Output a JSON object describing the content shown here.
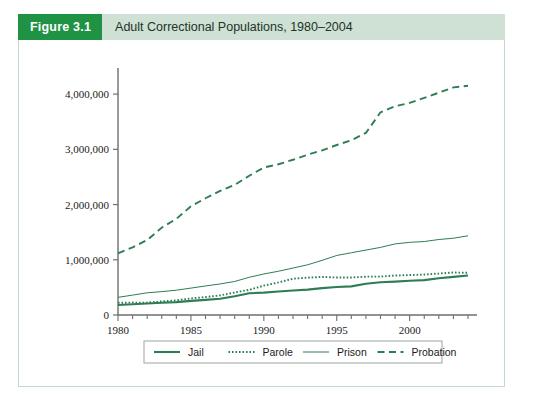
{
  "figure": {
    "number_label": "Figure 3.1",
    "title": "Adult Correctional Populations, 1980–2004"
  },
  "colors": {
    "header_badge_green": "#1f9244",
    "header_band_green": "#cfe0d4",
    "frame_border": "#c3d9c9",
    "series_green": "#2f7d52",
    "axis_gray": "#6e6e6e",
    "text_black": "#1a1a1a"
  },
  "chart_data": {
    "type": "line",
    "title": "Adult Correctional Populations, 1980–2004",
    "xlabel": "",
    "ylabel": "",
    "xlim": [
      1980,
      2004
    ],
    "ylim": [
      0,
      4400000
    ],
    "grid": false,
    "legend_position": "bottom",
    "x_ticks_major": [
      1980,
      1985,
      1990,
      1995,
      2000
    ],
    "x_tick_labels": [
      "1980",
      "1985",
      "1990",
      "1995",
      "2000"
    ],
    "x_ticks_minor_step": 1,
    "y_ticks": [
      0,
      1000000,
      2000000,
      3000000,
      4000000
    ],
    "y_tick_labels": [
      "0",
      "1,000,000",
      "2,000,000",
      "3,000,000",
      "4,000,000"
    ],
    "x": [
      1980,
      1981,
      1982,
      1983,
      1984,
      1985,
      1986,
      1987,
      1988,
      1989,
      1990,
      1991,
      1992,
      1993,
      1994,
      1995,
      1996,
      1997,
      1998,
      1999,
      2000,
      2001,
      2002,
      2003,
      2004
    ],
    "series": [
      {
        "name": "Jail",
        "style": "solid-thick",
        "values": [
          182000,
          196000,
          209000,
          223000,
          234000,
          256000,
          274000,
          295000,
          341000,
          395000,
          405000,
          426000,
          444000,
          459000,
          486000,
          507000,
          518000,
          567000,
          592000,
          605000,
          621000,
          631000,
          665000,
          691000,
          714000
        ]
      },
      {
        "name": "Parole",
        "style": "dotted",
        "values": [
          220000,
          225000,
          224000,
          246000,
          266000,
          300000,
          325000,
          355000,
          407000,
          456000,
          531000,
          590000,
          658000,
          676000,
          690000,
          679000,
          679000,
          694000,
          696000,
          714000,
          723000,
          732000,
          750000,
          769000,
          765000
        ]
      },
      {
        "name": "Prison",
        "style": "solid-thin",
        "values": [
          320000,
          360000,
          402000,
          423000,
          449000,
          487000,
          526000,
          562000,
          607000,
          683000,
          743000,
          792000,
          850000,
          909000,
          990000,
          1078000,
          1127000,
          1176000,
          1224000,
          1287000,
          1316000,
          1330000,
          1367000,
          1390000,
          1434000
        ]
      },
      {
        "name": "Probation",
        "style": "dashed",
        "values": [
          1118000,
          1225000,
          1357000,
          1582000,
          1740000,
          1968000,
          2114000,
          2247000,
          2356000,
          2522000,
          2670000,
          2729000,
          2811000,
          2903000,
          2981000,
          3078000,
          3164000,
          3297000,
          3670000,
          3780000,
          3840000,
          3932000,
          4025000,
          4121000,
          4152000
        ]
      }
    ],
    "legend_entries": [
      {
        "label": "Jail",
        "style": "solid-thick"
      },
      {
        "label": "Parole",
        "style": "dotted"
      },
      {
        "label": "Prison",
        "style": "solid-thin"
      },
      {
        "label": "Probation",
        "style": "dashed"
      }
    ]
  }
}
